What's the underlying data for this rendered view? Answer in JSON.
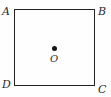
{
  "figure": {
    "type": "geometry-diagram",
    "shape": "square",
    "background_color": "#fefefe",
    "stroke_color": "#222222",
    "label_color": "#2b2b2b",
    "dot_color": "#141414",
    "vertices": [
      {
        "key": "a",
        "label": "A",
        "position": "top-left"
      },
      {
        "key": "b",
        "label": "B",
        "position": "top-right"
      },
      {
        "key": "c",
        "label": "C",
        "position": "bottom-right"
      },
      {
        "key": "d",
        "label": "D",
        "position": "bottom-left"
      }
    ],
    "center_point": {
      "label": "O",
      "marker": "filled-dot"
    }
  }
}
